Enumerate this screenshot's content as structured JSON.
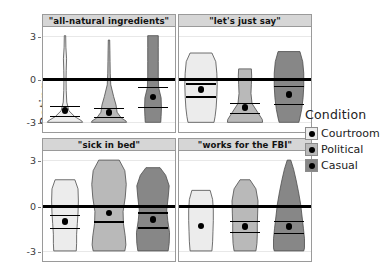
{
  "chart_data": {
    "type": "violin",
    "title": "",
    "xlabel": "",
    "ylabel": "Rating",
    "ylim": [
      -3.6,
      3.6
    ],
    "yticks": [
      3,
      0,
      -3
    ],
    "ytick_labels": [
      "3",
      "0",
      "-3"
    ],
    "grid": false,
    "zero_reference_line": 0,
    "legend": {
      "title": "Condition",
      "position": "right",
      "entries": [
        {
          "label": "Courtroom",
          "color": "#ececec"
        },
        {
          "label": "Political",
          "color": "#b9b9b9"
        },
        {
          "label": "Casual",
          "color": "#878787"
        }
      ]
    },
    "facets": [
      {
        "title": "\"all-natural ingredients\"",
        "groups": [
          {
            "name": "Courtroom",
            "mean": -2.2,
            "ci_low": -2.55,
            "ci_high": -1.85,
            "density_y": [
              3.0,
              2.2,
              1.4,
              0.6,
              0.0,
              -0.8,
              -1.6,
              -2.2,
              -2.6,
              -2.9,
              -3.0
            ],
            "density_w": [
              0.04,
              0.05,
              0.09,
              0.07,
              0.06,
              0.07,
              0.1,
              0.22,
              0.55,
              0.95,
              1.0
            ]
          },
          {
            "name": "Political",
            "mean": -2.3,
            "ci_low": -2.6,
            "ci_high": -2.0,
            "density_y": [
              2.7,
              2.0,
              1.2,
              0.4,
              -0.4,
              -1.2,
              -1.8,
              -2.3,
              -2.7,
              -2.9,
              -3.0
            ],
            "density_w": [
              0.04,
              0.05,
              0.06,
              0.07,
              0.1,
              0.26,
              0.4,
              0.46,
              0.7,
              0.96,
              1.0
            ]
          },
          {
            "name": "Casual",
            "mean": -1.25,
            "ci_low": -1.95,
            "ci_high": -0.55,
            "density_y": [
              3.0,
              2.2,
              1.2,
              0.2,
              -0.6,
              -1.3,
              -2.0,
              -2.6,
              -3.0
            ],
            "density_w": [
              0.3,
              0.3,
              0.3,
              0.3,
              0.32,
              0.46,
              0.48,
              0.46,
              0.44
            ]
          }
        ]
      },
      {
        "title": "\"let's just say\"",
        "groups": [
          {
            "name": "Courtroom",
            "mean": -0.75,
            "ci_low": -1.2,
            "ci_high": -0.3,
            "density_y": [
              1.8,
              1.2,
              0.4,
              -0.4,
              -1.2,
              -2.0,
              -2.6,
              -3.0
            ],
            "density_w": [
              0.62,
              0.84,
              0.9,
              0.92,
              0.9,
              0.86,
              0.8,
              0.74
            ]
          },
          {
            "name": "Political",
            "mean": -2.0,
            "ci_low": -2.35,
            "ci_high": -1.65,
            "density_y": [
              0.7,
              0.2,
              -0.4,
              -1.0,
              -1.7,
              -2.3,
              -2.8,
              -3.0
            ],
            "density_w": [
              0.36,
              0.38,
              0.36,
              0.34,
              0.4,
              0.72,
              0.98,
              1.0
            ]
          },
          {
            "name": "Casual",
            "mean": -1.1,
            "ci_low": -1.75,
            "ci_high": -0.5,
            "density_y": [
              1.9,
              1.2,
              0.4,
              -0.5,
              -1.3,
              -2.1,
              -2.7,
              -3.0
            ],
            "density_w": [
              0.62,
              0.78,
              0.84,
              0.84,
              0.8,
              0.72,
              0.62,
              0.56
            ]
          }
        ]
      },
      {
        "title": "\"sick in bed\"",
        "groups": [
          {
            "name": "Courtroom",
            "mean": -1.05,
            "ci_low": -1.5,
            "ci_high": -0.6,
            "density_y": [
              1.7,
              1.1,
              0.3,
              -0.5,
              -1.2,
              -1.9,
              -2.5,
              -3.0
            ],
            "density_w": [
              0.56,
              0.74,
              0.76,
              0.74,
              0.7,
              0.66,
              0.66,
              0.64
            ]
          },
          {
            "name": "Political",
            "mean": -0.5,
            "ci_low": -1.05,
            "ci_high": 0.05,
            "density_y": [
              3.0,
              2.3,
              1.4,
              0.5,
              -0.4,
              -1.2,
              -2.0,
              -2.6,
              -3.0
            ],
            "density_w": [
              0.58,
              0.9,
              0.98,
              0.92,
              0.8,
              0.82,
              0.92,
              0.96,
              0.9
            ]
          },
          {
            "name": "Casual",
            "mean": -0.95,
            "ci_low": -1.45,
            "ci_high": -0.45,
            "density_y": [
              2.5,
              2.0,
              1.3,
              0.5,
              -0.3,
              -1.0,
              -1.8,
              -2.5,
              -3.0
            ],
            "density_w": [
              0.4,
              0.72,
              0.92,
              0.86,
              0.78,
              0.84,
              0.94,
              0.92,
              0.86
            ]
          }
        ]
      },
      {
        "title": "\"works for the FBI\"",
        "groups": [
          {
            "name": "Courtroom",
            "mean": -1.35,
            "ci_low": -1.35,
            "ci_high": -1.35,
            "density_y": [
              1.0,
              0.4,
              -0.3,
              -1.0,
              -1.7,
              -2.4,
              -3.0
            ],
            "density_w": [
              0.52,
              0.66,
              0.7,
              0.7,
              0.68,
              0.66,
              0.62
            ]
          },
          {
            "name": "Political",
            "mean": -1.4,
            "ci_low": -1.75,
            "ci_high": -1.0,
            "density_y": [
              1.7,
              1.1,
              0.3,
              -0.5,
              -1.2,
              -1.9,
              -2.5,
              -3.0
            ],
            "density_w": [
              0.28,
              0.62,
              0.74,
              0.72,
              0.7,
              0.7,
              0.68,
              0.62
            ]
          },
          {
            "name": "Casual",
            "mean": -1.4,
            "ci_low": -1.8,
            "ci_high": -1.0,
            "density_y": [
              3.0,
              2.4,
              1.7,
              0.9,
              0.1,
              -0.7,
              -1.5,
              -2.2,
              -2.8,
              -3.0
            ],
            "density_w": [
              0.1,
              0.26,
              0.4,
              0.54,
              0.66,
              0.74,
              0.82,
              0.88,
              0.88,
              0.84
            ]
          }
        ]
      }
    ]
  },
  "axis": {
    "ylabel": "Rating",
    "ticks": [
      "3",
      "0",
      "-3"
    ]
  },
  "legend": {
    "title": "Condition",
    "items": [
      {
        "label": "Courtroom"
      },
      {
        "label": "Political"
      },
      {
        "label": "Casual"
      }
    ]
  },
  "facet_titles": [
    "\"all-natural ingredients\"",
    "\"let's just say\"",
    "\"sick in bed\"",
    "\"works for the FBI\""
  ],
  "colors": {
    "courtroom": "#ececec",
    "political": "#b9b9b9",
    "casual": "#878787",
    "stroke": "#4d4d4d",
    "strip_bg": "#d6d6d6",
    "panel_border": "#9a9a9a",
    "zero_line": "#000000"
  }
}
